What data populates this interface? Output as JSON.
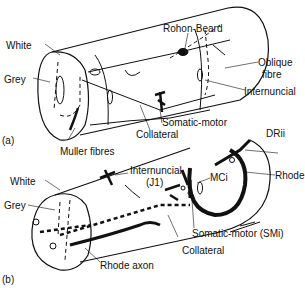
{
  "panel_a": {
    "tag": "(a)",
    "labels": {
      "white": "White",
      "grey": "Grey",
      "rohon_beard": "Rohon-Beard",
      "oblique_fibre_1": "Oblique",
      "oblique_fibre_2": "fibre",
      "internuncial": "Internuncial",
      "somatic_motor": "Somatic-motor",
      "collateral": "Collateral",
      "muller_fibres": "Muller fibres"
    }
  },
  "panel_b": {
    "tag": "(b)",
    "labels": {
      "white": "White",
      "grey": "Grey",
      "drii": "DRii",
      "internuncial_1": "Internuncial",
      "internuncial_2": "(J1)",
      "mci": "MCi",
      "rhode": "Rhode",
      "somatic_motor": "Somatic-motor (SMi)",
      "collateral": "Collateral",
      "rhode_axon": "Rhode axon"
    }
  }
}
